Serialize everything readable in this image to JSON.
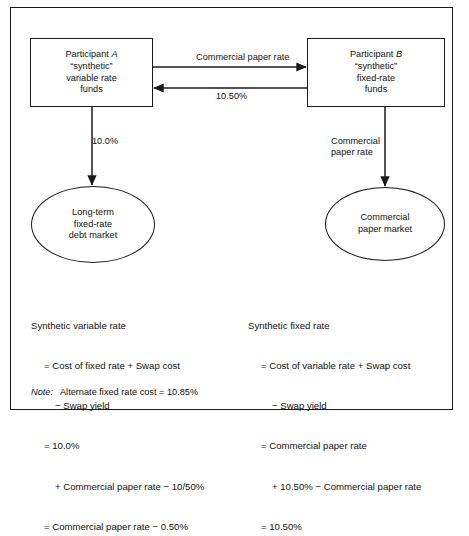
{
  "diagram": {
    "participant_a": {
      "line1_prefix": "Participant ",
      "line1_italic": "A",
      "line2": "“synthetic”",
      "line3": "variable rate",
      "line4": "funds"
    },
    "participant_b": {
      "line1_prefix": "Participant ",
      "line1_italic": "B",
      "line2": "“synthetic”",
      "line3": "fixed-rate",
      "line4": "funds"
    },
    "arrow_a_to_b_label": "Commercial paper rate",
    "arrow_b_to_a_label": "10.50%",
    "arrow_a_down_label": "10.0%",
    "arrow_b_down_label": "Commercial\npaper rate",
    "market_left": "Long-term\nfixed-rate\ndebt market",
    "market_right": "Commercial\npaper market"
  },
  "calc_left": {
    "title": "Synthetic variable rate",
    "lines": [
      "= Cost of fixed rate + Swap cost",
      "− Swap yield",
      "= 10.0%",
      "+ Commercial paper rate − 10/50%",
      "= Commercial paper rate − 0.50%"
    ]
  },
  "calc_right": {
    "title": "Synthetic fixed rate",
    "lines": [
      "= Cost of variable rate + Swap cost",
      "− Swap yield",
      "= Commercial paper rate",
      "+ 10.50% − Commercial paper rate",
      "= 10.50%"
    ]
  },
  "note": {
    "label": "Note:",
    "text": "Alternate fixed rate cost = 10.85%"
  },
  "colors": {
    "ink": "#1a1a1a",
    "paper": "#ffffff"
  }
}
